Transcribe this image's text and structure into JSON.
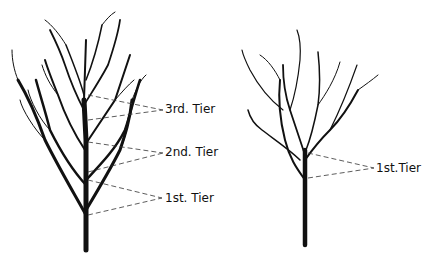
{
  "figure": {
    "left_tree": {
      "labels": [
        {
          "text": "3rd. Tier"
        },
        {
          "text": "2nd. Tier"
        },
        {
          "text": "1st. Tier"
        }
      ]
    },
    "right_tree": {
      "labels": [
        {
          "text": "1st.Tier"
        }
      ]
    },
    "colors": {
      "ink": "#111111",
      "background": "#ffffff"
    }
  }
}
